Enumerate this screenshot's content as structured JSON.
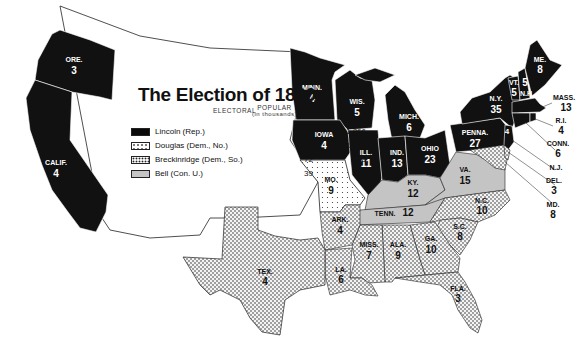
{
  "title": "The Election of 1860",
  "columns": {
    "electoral": "ELECTORAL",
    "popular": "POPULAR",
    "popular_sub": "(in thousands)"
  },
  "colors": {
    "lincoln": "#0a0a0a",
    "douglas": "#ffffff",
    "breckinridge": "#f1f1f1",
    "bell": "#c4c4c4",
    "border": "#222222"
  },
  "legend": [
    {
      "id": "lincoln",
      "label": "Lincoln (Rep.)",
      "electoral": "180",
      "popular": "1,866",
      "pattern": "solid-black"
    },
    {
      "id": "douglas",
      "label": "Douglas (Dem., No.)",
      "electoral": "12",
      "popular": "1,383",
      "pattern": "sparse-dots"
    },
    {
      "id": "breckinridge",
      "label": "Breckinridge (Dem., So.)",
      "electoral": "72",
      "popular": "848",
      "pattern": "dense-dots"
    },
    {
      "id": "bell",
      "label": "Bell (Con. U.)",
      "electoral": "39",
      "popular": "593",
      "pattern": "gray"
    }
  ],
  "states": {
    "ore": {
      "name": "ORE.",
      "votes": "3",
      "party": "lincoln"
    },
    "calif": {
      "name": "CALIF.",
      "votes": "4",
      "party": "lincoln"
    },
    "minn": {
      "name": "MINN.",
      "votes": "4",
      "party": "lincoln"
    },
    "wis": {
      "name": "WIS.",
      "votes": "5",
      "party": "lincoln"
    },
    "mich": {
      "name": "MICH.",
      "votes": "6",
      "party": "lincoln"
    },
    "iowa": {
      "name": "IOWA",
      "votes": "4",
      "party": "lincoln"
    },
    "ill": {
      "name": "ILL.",
      "votes": "11",
      "party": "lincoln"
    },
    "ind": {
      "name": "IND.",
      "votes": "13",
      "party": "lincoln"
    },
    "ohio": {
      "name": "OHIO",
      "votes": "23",
      "party": "lincoln"
    },
    "penna": {
      "name": "PENNA.",
      "votes": "27",
      "party": "lincoln"
    },
    "ny": {
      "name": "N.Y.",
      "votes": "35",
      "party": "lincoln"
    },
    "vt": {
      "name": "VT.",
      "votes": "5",
      "party": "lincoln"
    },
    "nh": {
      "name": "N.H.",
      "votes": "5",
      "party": "lincoln"
    },
    "me": {
      "name": "ME.",
      "votes": "8",
      "party": "lincoln"
    },
    "mass": {
      "name": "MASS.",
      "votes": "13",
      "party": "lincoln"
    },
    "ri": {
      "name": "R.I.",
      "votes": "4",
      "party": "lincoln"
    },
    "conn": {
      "name": "CONN.",
      "votes": "6",
      "party": "lincoln"
    },
    "nj": {
      "name": "N.J.",
      "votes": "4",
      "split": "3",
      "party": "lincoln"
    },
    "del": {
      "name": "DEL.",
      "votes": "3",
      "party": "breckinridge"
    },
    "md": {
      "name": "MD.",
      "votes": "8",
      "party": "breckinridge"
    },
    "mo": {
      "name": "MO.",
      "votes": "9",
      "party": "douglas"
    },
    "ky": {
      "name": "KY.",
      "votes": "12",
      "party": "bell"
    },
    "va": {
      "name": "VA.",
      "votes": "15",
      "party": "bell"
    },
    "tenn": {
      "name": "TENN.",
      "votes": "12",
      "party": "bell"
    },
    "nc": {
      "name": "N.C.",
      "votes": "10",
      "party": "breckinridge"
    },
    "sc": {
      "name": "S.C.",
      "votes": "8",
      "party": "breckinridge"
    },
    "ga": {
      "name": "GA.",
      "votes": "10",
      "party": "breckinridge"
    },
    "ala": {
      "name": "ALA.",
      "votes": "9",
      "party": "breckinridge"
    },
    "miss": {
      "name": "MISS.",
      "votes": "7",
      "party": "breckinridge"
    },
    "la": {
      "name": "LA.",
      "votes": "6",
      "party": "breckinridge"
    },
    "ark": {
      "name": "ARK.",
      "votes": "4",
      "party": "breckinridge"
    },
    "tex": {
      "name": "TEX.",
      "votes": "4",
      "party": "breckinridge"
    },
    "fla": {
      "name": "FLA.",
      "votes": "3",
      "party": "breckinridge"
    }
  }
}
